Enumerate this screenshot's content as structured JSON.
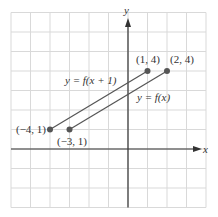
{
  "figure": {
    "axes": {
      "x_label": "x",
      "y_label": "y"
    },
    "grid": {
      "x_min": -6,
      "x_max": 4,
      "y_min": -3,
      "y_max": 7,
      "unit_px": 19.5,
      "origin_px": [
        128,
        149
      ]
    },
    "colors": {
      "grid": "#d9d9d9",
      "axis": "#333333",
      "line": "#555555",
      "point": "#555555"
    },
    "lines": [
      {
        "label": "y = f(x + 1)",
        "from": [
          -4,
          1
        ],
        "to": [
          1,
          4
        ]
      },
      {
        "label": "y = f(x)",
        "from": [
          -3,
          1
        ],
        "to": [
          2,
          4
        ]
      }
    ],
    "points": [
      {
        "label": "(−4, 1)",
        "x": -4,
        "y": 1
      },
      {
        "label": "(−3, 1)",
        "x": -3,
        "y": 1
      },
      {
        "label": "(1, 4)",
        "x": 1,
        "y": 4
      },
      {
        "label": "(2, 4)",
        "x": 2,
        "y": 4
      }
    ],
    "line_labels": {
      "shifted": "y = f(x + 1)",
      "original": "y = f(x)"
    }
  }
}
